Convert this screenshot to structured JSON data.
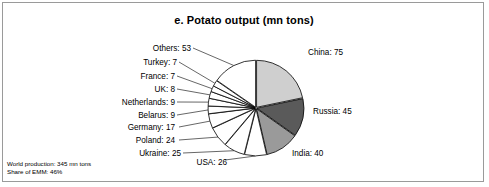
{
  "chart_data": {
    "type": "pie",
    "title": "e. Potato output (mn tons)",
    "unit": "mn tons",
    "categories": [
      "China",
      "Russia",
      "India",
      "USA",
      "Ukraine",
      "Poland",
      "Germany",
      "Belarus",
      "Netherlands",
      "UK",
      "France",
      "Turkey",
      "Others"
    ],
    "values": [
      75,
      45,
      40,
      26,
      25,
      24,
      17,
      9,
      9,
      8,
      7,
      7,
      53
    ],
    "labels": [
      "China: 75",
      "Russia: 45",
      "India: 40",
      "USA: 26",
      "Ukraine: 25",
      "Poland: 24",
      "Germany: 17",
      "Belarus: 9",
      "Netherlands: 9",
      "UK: 8",
      "France: 7",
      "Turkey: 7",
      "Others: 53"
    ],
    "total": 345,
    "start_angle_deg": 0,
    "direction": "clockwise",
    "legend": "none",
    "grid": false,
    "slice_colors": [
      "#cfcfcf",
      "#5a5a5a",
      "#9a9a9a",
      "#ffffff",
      "#ffffff",
      "#ffffff",
      "#ffffff",
      "#ffffff",
      "#ffffff",
      "#ffffff",
      "#ffffff",
      "#ffffff",
      "#ffffff"
    ],
    "outline_color": "#000000"
  },
  "footer": {
    "line1": "World production: 345 mn tons",
    "line2": "Share of EMM: 46%"
  },
  "colors": {
    "frame_border": "#9a9a9a",
    "text": "#000000",
    "background": "#ffffff"
  }
}
